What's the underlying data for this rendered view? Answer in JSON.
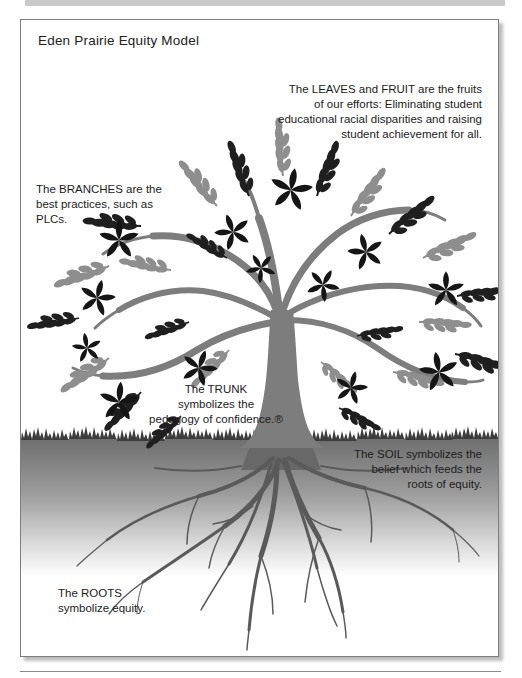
{
  "figure": {
    "title": "Eden Prairie Equity Model"
  },
  "captions": {
    "leaves_fruit": {
      "lines": [
        "The LEAVES and FRUIT are the fruits",
        "of our efforts: Eliminating student",
        "educational racial disparities and raising",
        "student achievement for all."
      ]
    },
    "branches": {
      "lines": [
        "The BRANCHES are the",
        "best practices, such as",
        "PLCs."
      ]
    },
    "trunk": {
      "lines": [
        "The TRUNK",
        "symbolizes the",
        "pedagogy of confidence.®"
      ]
    },
    "soil": {
      "lines": [
        "The SOIL symbolizes the",
        "belief which feeds the",
        "roots of equity."
      ]
    },
    "roots": {
      "lines": [
        "The ROOTS",
        "symbolize equity."
      ]
    }
  },
  "illustration": {
    "name": "equity-tree",
    "colors": {
      "leaf_dark": "#1f1f1f",
      "leaf_gray": "#8e8e8e",
      "flower": "#151515",
      "trunk": "#7d7d7d",
      "grass": "#3c3c3c",
      "soil_top": "#6f6f6f",
      "soil_bottom": "#ffffff",
      "root": "#5a5a5a"
    }
  }
}
